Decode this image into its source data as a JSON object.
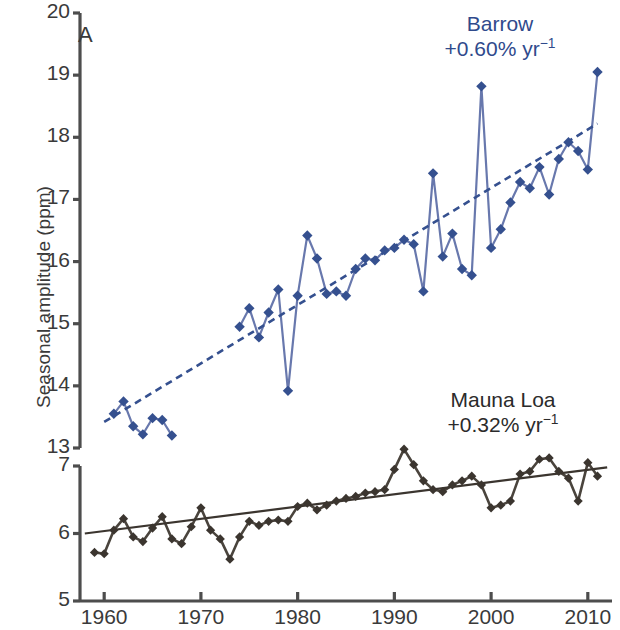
{
  "figure": {
    "panel_tag": "A",
    "ylabel": "Seasonal amplitude (ppm)"
  },
  "annotations": {
    "barrow": {
      "name": "Barrow",
      "rate": "+0.60% yr",
      "rate_exp": "−1",
      "rate_prefix": "+0.60% yr"
    },
    "mauna": {
      "name": "Mauna Loa",
      "rate_prefix": "+0.32% yr",
      "rate_exp": "−1"
    }
  },
  "colors": {
    "barrow": "#35508f",
    "barrow_line": "#6878ad",
    "mauna": "#3b352f",
    "mauna_line": "#4a443d",
    "axis": "#4d4d4d"
  },
  "chart_data": {
    "type": "line",
    "title": "",
    "xlabel": "",
    "ylabel": "Seasonal amplitude (ppm)",
    "xlim": [
      1957.5,
      2012.5
    ],
    "grid": false,
    "legend_position": "inline-annotation",
    "panels": [
      {
        "name": "Barrow",
        "ylim": [
          13,
          20
        ],
        "yticks": [
          13,
          14,
          15,
          16,
          17,
          18,
          19,
          20
        ],
        "trend_rate_percent_per_year": 0.6,
        "trend_style": "dashed",
        "marker": "diamond",
        "color": "#35508f",
        "trend_endpoints": {
          "x": [
            1960.0,
            2011.0
          ],
          "y": [
            13.42,
            18.22
          ]
        },
        "x": [
          1961,
          1962,
          1963,
          1964,
          1965,
          1966,
          1967,
          1974,
          1975,
          1976,
          1977,
          1978,
          1979,
          1980,
          1981,
          1982,
          1983,
          1984,
          1985,
          1986,
          1987,
          1988,
          1989,
          1990,
          1991,
          1992,
          1993,
          1994,
          1995,
          1996,
          1997,
          1998,
          1999,
          2000,
          2001,
          2002,
          2003,
          2004,
          2005,
          2006,
          2007,
          2008,
          2009,
          2010,
          2011
        ],
        "y": [
          13.55,
          13.75,
          13.35,
          13.22,
          13.48,
          13.45,
          13.2,
          14.95,
          15.25,
          14.78,
          15.18,
          15.55,
          13.92,
          15.45,
          16.42,
          16.05,
          15.48,
          15.52,
          15.45,
          15.88,
          16.05,
          16.02,
          16.18,
          16.22,
          16.35,
          16.28,
          15.52,
          17.42,
          16.08,
          16.45,
          15.88,
          15.78,
          18.82,
          16.22,
          16.52,
          16.95,
          17.28,
          17.18,
          17.52,
          17.08,
          17.65,
          17.92,
          17.78,
          17.48,
          19.05
        ]
      },
      {
        "name": "Mauna Loa",
        "ylim": [
          5,
          7.5
        ],
        "yticks": [
          5,
          6,
          7
        ],
        "trend_rate_percent_per_year": 0.32,
        "trend_style": "solid",
        "marker": "diamond",
        "color": "#3b352f",
        "trend_endpoints": {
          "x": [
            1958.0,
            2012.0
          ],
          "y": [
            6.0,
            6.98
          ]
        },
        "x": [
          1959,
          1960,
          1961,
          1962,
          1963,
          1964,
          1965,
          1966,
          1967,
          1968,
          1969,
          1970,
          1971,
          1972,
          1973,
          1974,
          1975,
          1976,
          1977,
          1978,
          1979,
          1980,
          1981,
          1982,
          1983,
          1984,
          1985,
          1986,
          1987,
          1988,
          1989,
          1990,
          1991,
          1992,
          1993,
          1994,
          1995,
          1996,
          1997,
          1998,
          1999,
          2000,
          2001,
          2002,
          2003,
          2004,
          2005,
          2006,
          2007,
          2008,
          2009,
          2010,
          2011
        ],
        "y": [
          5.72,
          5.7,
          6.05,
          6.22,
          5.95,
          5.88,
          6.08,
          6.25,
          5.92,
          5.85,
          6.1,
          6.38,
          6.05,
          5.92,
          5.62,
          5.95,
          6.18,
          6.12,
          6.18,
          6.2,
          6.18,
          6.4,
          6.45,
          6.35,
          6.42,
          6.48,
          6.52,
          6.55,
          6.6,
          6.62,
          6.65,
          6.95,
          7.25,
          7.02,
          6.78,
          6.65,
          6.62,
          6.72,
          6.78,
          6.85,
          6.72,
          6.38,
          6.42,
          6.48,
          6.88,
          6.92,
          7.1,
          7.12,
          6.92,
          6.82,
          6.48,
          7.05,
          6.85
        ]
      }
    ]
  },
  "ticks": {
    "upper_y": [
      "20",
      "19",
      "18",
      "17",
      "16",
      "15",
      "14",
      "13"
    ],
    "lower_y": [
      "7",
      "6",
      "5"
    ],
    "x": [
      "1960",
      "1970",
      "1980",
      "1990",
      "2000",
      "2010"
    ]
  }
}
